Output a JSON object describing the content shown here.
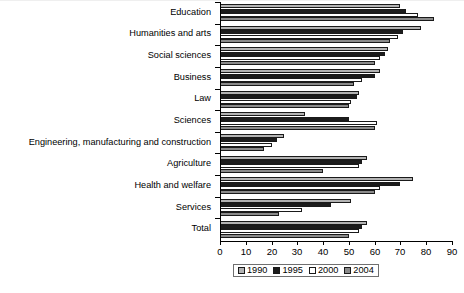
{
  "chart_data": {
    "type": "bar",
    "orientation": "horizontal",
    "title": "",
    "xlabel": "",
    "ylabel": "",
    "xlim": [
      0,
      90
    ],
    "grid": false,
    "legend_position": "bottom",
    "xticks": [
      0,
      10,
      20,
      30,
      40,
      50,
      60,
      70,
      80,
      90
    ],
    "categories": [
      "Education",
      "Humanities and arts",
      "Social sciences",
      "Business",
      "Law",
      "Sciences",
      "Engineering, manufacturing and construction",
      "Agriculture",
      "Health and welfare",
      "Services",
      "Total"
    ],
    "series": [
      {
        "name": "1990",
        "color": "#b3b3b3",
        "values": [
          70,
          78,
          65,
          62,
          54,
          33,
          25,
          57,
          75,
          51,
          57
        ]
      },
      {
        "name": "1995",
        "color": "#1c1c1c",
        "values": [
          72,
          71,
          64,
          60,
          53,
          50,
          22,
          55,
          70,
          43,
          55
        ]
      },
      {
        "name": "2000",
        "color": "#ffffff",
        "values": [
          77,
          69,
          62,
          55,
          51,
          61,
          20,
          54,
          62,
          32,
          54
        ]
      },
      {
        "name": "2004",
        "color": "#8a8a8a",
        "values": [
          83,
          66,
          60,
          52,
          50,
          60,
          17,
          40,
          60,
          23,
          50
        ]
      }
    ]
  },
  "legend": {
    "items": [
      {
        "label": "1990",
        "swatch": "#b3b3b3"
      },
      {
        "label": "1995",
        "swatch": "#1c1c1c"
      },
      {
        "label": "2000",
        "swatch": "#ffffff"
      },
      {
        "label": "2004",
        "swatch": "#8a8a8a"
      }
    ]
  },
  "colors": {
    "axis": "#000000",
    "legend_border": "#6f6f6f",
    "bar_outline": "#1a1a1a",
    "background": "#ffffff"
  }
}
